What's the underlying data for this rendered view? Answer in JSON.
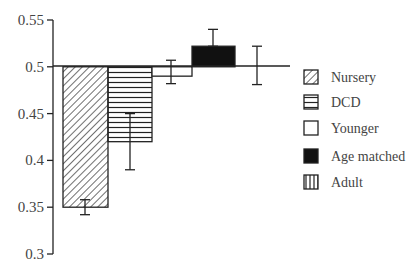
{
  "chart_data": {
    "type": "bar",
    "title": "",
    "xlabel": "",
    "ylabel": "",
    "ylim": [
      0.3,
      0.55
    ],
    "baseline": 0.5,
    "yticks": [
      0.55,
      0.5,
      0.45,
      0.4,
      0.35,
      0.3
    ],
    "ytick_labels": [
      "0.55",
      "0.5",
      "0.45",
      "0.4",
      "0.35",
      "0.3"
    ],
    "grid": false,
    "legend_position": "right",
    "categories": [
      "Nursery",
      "DCD",
      "Younger",
      "Age matched",
      "Adult"
    ],
    "values": [
      0.35,
      0.42,
      0.49,
      0.522,
      0.5
    ],
    "error_low": [
      0.342,
      0.39,
      0.482,
      0.522,
      0.481
    ],
    "error_high": [
      0.358,
      0.45,
      0.507,
      0.54,
      0.522
    ],
    "series": [
      {
        "name": "Nursery",
        "value": 0.35,
        "err_low": 0.342,
        "err_high": 0.358,
        "pattern": "diagonal-hatch"
      },
      {
        "name": "DCD",
        "value": 0.42,
        "err_low": 0.39,
        "err_high": 0.45,
        "pattern": "horizontal-lines"
      },
      {
        "name": "Younger",
        "value": 0.49,
        "err_low": 0.482,
        "err_high": 0.507,
        "pattern": "empty"
      },
      {
        "name": "Age matched",
        "value": 0.522,
        "err_low": 0.522,
        "err_high": 0.54,
        "pattern": "solid-black"
      },
      {
        "name": "Adult",
        "value": 0.5,
        "err_low": 0.481,
        "err_high": 0.522,
        "pattern": "vertical-lines"
      }
    ]
  },
  "legend": {
    "items": [
      {
        "label": "Nursery"
      },
      {
        "label": "DCD"
      },
      {
        "label": "Younger"
      },
      {
        "label": "Age matched"
      },
      {
        "label": "Adult"
      }
    ]
  }
}
